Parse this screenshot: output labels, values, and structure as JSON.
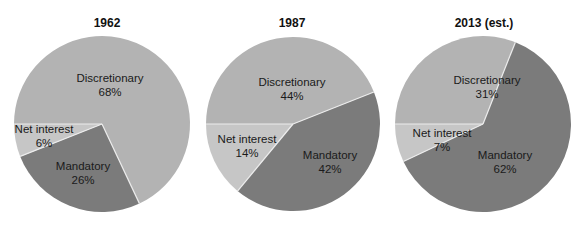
{
  "chart_data": [
    {
      "type": "pie",
      "title": "1962",
      "categories": [
        "Discretionary",
        "Mandatory",
        "Net interest"
      ],
      "values": [
        68,
        26,
        6
      ],
      "labels": [
        "68%",
        "26%",
        "6%"
      ],
      "start_angle_deg": 180,
      "direction": "clockwise",
      "center": [
        102,
        124
      ],
      "radius": 88,
      "label_positions": [
        [
          110,
          78
        ],
        [
          83,
          166
        ],
        [
          44,
          129
        ]
      ]
    },
    {
      "type": "pie",
      "title": "1987",
      "categories": [
        "Discretionary",
        "Mandatory",
        "Net interest"
      ],
      "values": [
        44,
        42,
        14
      ],
      "labels": [
        "44%",
        "42%",
        "14%"
      ],
      "start_angle_deg": 180,
      "direction": "clockwise",
      "center": [
        293,
        124
      ],
      "radius": 87,
      "label_positions": [
        [
          292,
          82
        ],
        [
          330,
          155
        ],
        [
          247,
          139
        ]
      ]
    },
    {
      "type": "pie",
      "title": "2013 (est.)",
      "categories": [
        "Discretionary",
        "Mandatory",
        "Net interest"
      ],
      "values": [
        31,
        62,
        7
      ],
      "labels": [
        "31%",
        "62%",
        "7%"
      ],
      "start_angle_deg": 180,
      "direction": "clockwise",
      "center": [
        483,
        124
      ],
      "radius": 88,
      "label_positions": [
        [
          487,
          80
        ],
        [
          505,
          155
        ],
        [
          442,
          133
        ]
      ]
    }
  ],
  "colors": {
    "Discretionary": "#b3b3b3",
    "Mandatory": "#7b7b7b",
    "Net interest": "#c6c6c6",
    "separator": "#ececec"
  },
  "legend": "none"
}
